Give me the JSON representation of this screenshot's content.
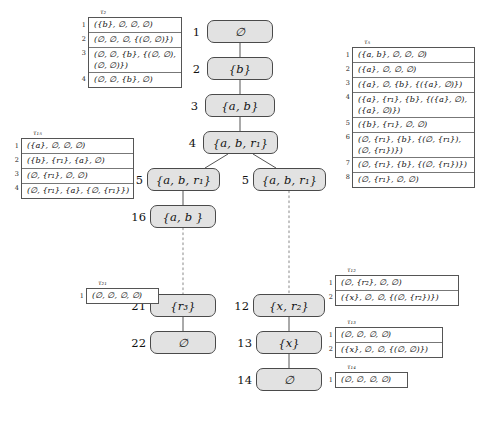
{
  "figure": {
    "kind": "annotated-tree-diagram",
    "node_fill": "#e2e2e2",
    "node_stroke": "#4a4a4a",
    "edge_solid_color": "#555555",
    "edge_dotted_color": "#999999"
  },
  "nodes": [
    {
      "id": "1",
      "label": "∅"
    },
    {
      "id": "2",
      "label": "{b}"
    },
    {
      "id": "3",
      "label": "{a, b}"
    },
    {
      "id": "4",
      "label": "{a, b, r₁}"
    },
    {
      "id": "15",
      "label": "{a, b, r₁}"
    },
    {
      "id": "5",
      "label": "{a, b, r₁}"
    },
    {
      "id": "16",
      "label": "{a, b }"
    },
    {
      "id": "21",
      "label": "{r₃}"
    },
    {
      "id": "12",
      "label": "{x, r₂}"
    },
    {
      "id": "22",
      "label": "∅"
    },
    {
      "id": "13",
      "label": "{x}"
    },
    {
      "id": "14",
      "label": "∅"
    }
  ],
  "edges": [
    {
      "from": "1",
      "to": "2",
      "style": "solid"
    },
    {
      "from": "2",
      "to": "3",
      "style": "solid"
    },
    {
      "from": "3",
      "to": "4",
      "style": "solid"
    },
    {
      "from": "4",
      "to": "15",
      "style": "solid"
    },
    {
      "from": "4",
      "to": "5",
      "style": "solid"
    },
    {
      "from": "15",
      "to": "16",
      "style": "solid"
    },
    {
      "from": "16",
      "to": "21",
      "style": "dotted"
    },
    {
      "from": "5",
      "to": "12",
      "style": "dotted"
    },
    {
      "from": "21",
      "to": "22",
      "style": "solid"
    },
    {
      "from": "12",
      "to": "13",
      "style": "solid"
    },
    {
      "from": "13",
      "to": "14",
      "style": "solid"
    }
  ],
  "tables": [
    {
      "key": "t2",
      "label": "τ₂",
      "rows": [
        {
          "num": "1",
          "lines": [
            "({b}, ∅, ∅, ∅)"
          ]
        },
        {
          "num": "2",
          "lines": [
            "(∅, ∅, ∅, {(∅, ∅)})"
          ]
        },
        {
          "num": "3",
          "lines": [
            "(∅, ∅, {b}, {(∅, ∅),",
            "(∅, ∅)})"
          ]
        },
        {
          "num": "4",
          "lines": [
            "(∅, ∅, {b}, ∅)"
          ]
        }
      ]
    },
    {
      "key": "t5",
      "label": "τ₅",
      "rows": [
        {
          "num": "1",
          "lines": [
            "({a, b}, ∅, ∅, ∅)"
          ]
        },
        {
          "num": "2",
          "lines": [
            "({a}, ∅, ∅, ∅)"
          ]
        },
        {
          "num": "3",
          "lines": [
            "({a}, ∅, {b}, {({a}, ∅)})"
          ]
        },
        {
          "num": "4",
          "lines": [
            "({a}, {r₁}, {b}, {({a}, ∅),",
            "({a}, ∅)})"
          ]
        },
        {
          "num": "5",
          "lines": [
            "({b}, {r₁}, ∅, ∅)"
          ]
        },
        {
          "num": "6",
          "lines": [
            "(∅, {r₁}, {b}, {(∅, {r₁}),",
            "(∅, {r₁})})"
          ]
        },
        {
          "num": "7",
          "lines": [
            "(∅, {r₁}, {b}, {(∅, {r₁})})"
          ]
        },
        {
          "num": "8",
          "lines": [
            "(∅, {r₁}, ∅, ∅)"
          ]
        }
      ]
    },
    {
      "key": "t15",
      "label": "τ₁₅",
      "rows": [
        {
          "num": "1",
          "lines": [
            "({a}, ∅, ∅, ∅)"
          ]
        },
        {
          "num": "2",
          "lines": [
            "({b}, {r₁}, {a}, ∅)"
          ]
        },
        {
          "num": "3",
          "lines": [
            "(∅, {r₁}, ∅, ∅)"
          ]
        },
        {
          "num": "4",
          "lines": [
            "(∅, {r₁}, {a}, {∅, {r₁}})"
          ]
        }
      ]
    },
    {
      "key": "t21",
      "label": "τ₂₁",
      "rows": [
        {
          "num": "1",
          "lines": [
            "(∅, ∅, ∅,  ∅)"
          ]
        }
      ]
    },
    {
      "key": "t12",
      "label": "τ₁₂",
      "rows": [
        {
          "num": "1",
          "lines": [
            "(∅, {r₂}, ∅,  ∅)"
          ]
        },
        {
          "num": "2",
          "lines": [
            "({x}, ∅, ∅,  {(∅, {r₂})})"
          ]
        }
      ]
    },
    {
      "key": "t13",
      "label": "τ₁₃",
      "rows": [
        {
          "num": "1",
          "lines": [
            "(∅, ∅, ∅,  ∅)"
          ]
        },
        {
          "num": "2",
          "lines": [
            "({x}, ∅, ∅,  {(∅, ∅)})"
          ]
        }
      ]
    },
    {
      "key": "t14",
      "label": "τ₁₄",
      "rows": [
        {
          "num": "1",
          "lines": [
            "(∅, ∅, ∅,  ∅)"
          ]
        }
      ]
    }
  ]
}
